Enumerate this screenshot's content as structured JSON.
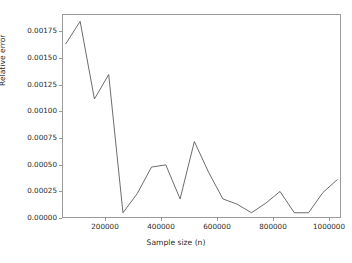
{
  "chart_data": {
    "type": "line",
    "title": "",
    "xlabel": "Sample size (n)",
    "ylabel": "Relative error",
    "xlim": [
      40000,
      1010000
    ],
    "ylim": [
      0.0,
      0.0019
    ],
    "grid": false,
    "legend": null,
    "xticks": [
      200000,
      400000,
      600000,
      800000,
      1000000
    ],
    "xtick_labels": [
      "200000",
      "400000",
      "600000",
      "800000",
      "1000000"
    ],
    "yticks": [
      0.0,
      0.00025,
      0.0005,
      0.00075,
      0.001,
      0.00125,
      0.0015,
      0.00175
    ],
    "ytick_labels": [
      "0.00000",
      "0.00025",
      "0.00050",
      "0.00075",
      "0.00100",
      "0.00125",
      "0.00150",
      "0.00175"
    ],
    "line_color": "#5a5a5a",
    "series": [
      {
        "name": "relative error",
        "x": [
          50000,
          100000,
          150000,
          200000,
          250000,
          300000,
          350000,
          400000,
          450000,
          500000,
          550000,
          600000,
          650000,
          700000,
          750000,
          800000,
          850000,
          900000,
          950000,
          1000000
        ],
        "y": [
          0.00163,
          0.00184,
          0.00111,
          0.00134,
          4e-05,
          0.00022,
          0.00047,
          0.00049,
          0.00017,
          0.00071,
          0.00042,
          0.00017,
          0.00012,
          4e-05,
          0.00013,
          0.00024,
          4e-05,
          4e-05,
          0.00023,
          0.00035
        ]
      }
    ]
  },
  "axis": {
    "xlabel": "Sample size (n)",
    "ylabel": "Relative error"
  }
}
